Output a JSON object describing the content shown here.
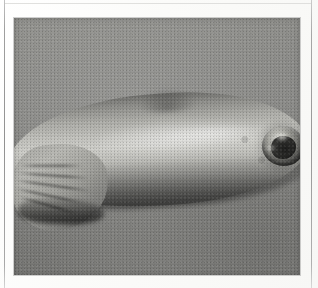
{
  "page": {
    "background_color": "#ffffff",
    "width": 318,
    "height": 288,
    "frame_rule_color": "#858585"
  },
  "figure": {
    "kind": "clinical-photograph",
    "medium": "grayscale halftone scan",
    "alt_text": "Black and white clinical photograph of a forearm and hand resting on a plain grey background, with a single raised crusted nodular skin lesion on the forearm near the upper right of the frame.",
    "caption": "",
    "photo": {
      "left": 14,
      "top": 18,
      "width": 286,
      "height": 257,
      "background_color": "#8b8b8b",
      "highlight_color": "#cfcfca",
      "shadow_color": "#5a5a58"
    },
    "subject": {
      "anatomy": "forearm and hand",
      "orientation": "horizontal, hand at lower left, elbow end at right",
      "features": [
        "specular highlight along the mid forearm",
        "deep skin creases at the wrist and base of the thumb",
        "slight contour bump on the upper forearm border"
      ]
    },
    "lesion": {
      "label": "crusted nodule",
      "position": "upper right forearm",
      "appearance": "round raised nodule with dark crusted centre and irregular scaly surface",
      "core_color": "#2c2c2a",
      "rim_color": "#a6a6a0"
    }
  }
}
